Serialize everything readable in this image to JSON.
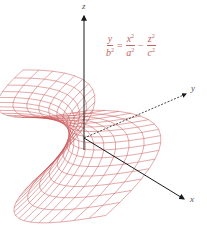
{
  "diagram": {
    "axes": {
      "z_label": "z",
      "y_label": "y",
      "x_label": "x"
    },
    "equation": {
      "lhs": {
        "num": "y",
        "den_base": "b",
        "den_exp": "2"
      },
      "equals": "=",
      "term1": {
        "num_base": "x",
        "num_exp": "2",
        "den_base": "a",
        "den_exp": "2"
      },
      "minus": "−",
      "term2": {
        "num_base": "z",
        "num_exp": "2",
        "den_base": "c",
        "den_exp": "2"
      }
    },
    "colors": {
      "surface_mesh": "#c0393b",
      "axes": "#1a1a1a",
      "equation": "#c0655f",
      "background": "#ffffff"
    }
  }
}
